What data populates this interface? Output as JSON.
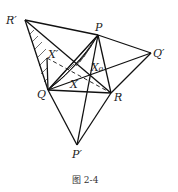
{
  "figure": {
    "caption": "图 2-4",
    "points": {
      "R_prime": {
        "label": "R′",
        "x": 25,
        "y": 20
      },
      "P": {
        "label": "P",
        "x": 98,
        "y": 35
      },
      "Q_prime": {
        "label": "Q′",
        "x": 151,
        "y": 53
      },
      "Q": {
        "label": "Q",
        "x": 48,
        "y": 90
      },
      "R": {
        "label": "R",
        "x": 111,
        "y": 93
      },
      "P_prime": {
        "label": "P′",
        "x": 77,
        "y": 145
      },
      "X_prime": {
        "label": "X′",
        "x": 47,
        "y": 58
      },
      "X": {
        "label": "X",
        "x": 72,
        "y": 80
      },
      "X0": {
        "label": "X₀",
        "x": 91,
        "y": 75
      }
    },
    "line_color": "#111111"
  }
}
